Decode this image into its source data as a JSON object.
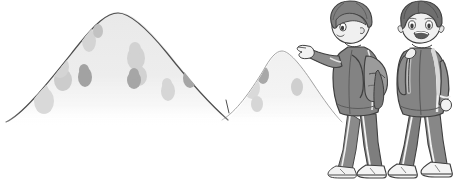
{
  "illustration": {
    "title": "Two boys in tracksuits looking at hills",
    "caption": "A boy points toward two hills while his friend smiles beside him",
    "style": "grayscale cartoon line drawing",
    "background_color": "#ffffff"
  },
  "palette": {
    "outline": "#3c3c3c",
    "hill_outline": "#555555",
    "hill_fill_front": "#eeeeee",
    "hill_fill_back": "#f4f4f4",
    "blob_light": "#dcdcdc",
    "blob_mid": "#c9c9c9",
    "blob_dark": "#a8a8a8",
    "skin": "#f0f0f0",
    "skin_shadow": "#d6d6d6",
    "hair_dark": "#5a5a5a",
    "hair_mid": "#8a8a8a",
    "hair_light": "#b4b4b4",
    "tracksuit_dark": "#6e6e6e",
    "tracksuit_mid": "#8d8d8d",
    "tracksuit_light": "#a5a5a5",
    "stripe": "#f2f2f2",
    "backpack": "#999999",
    "backpack_dark": "#7a7a7a",
    "shoe_white": "#f5f5f5",
    "shoe_grey": "#9a9a9a"
  },
  "landscape": {
    "name": "two-hills",
    "hills": [
      {
        "id": "hill-front",
        "label": "Large front hill",
        "peak_x": 116,
        "peak_y": 12,
        "left_x": 8,
        "right_x": 230,
        "base_y": 122
      },
      {
        "id": "hill-back",
        "label": "Smaller back hill",
        "peak_x": 272,
        "peak_y": 52,
        "left_x": 222,
        "right_x": 340,
        "base_y": 122
      }
    ],
    "blobs": [
      {
        "cx": 44,
        "cy": 101,
        "rx": 10,
        "ry": 13,
        "tone": "blob_light"
      },
      {
        "cx": 63,
        "cy": 80,
        "rx": 9,
        "ry": 11,
        "tone": "blob_mid"
      },
      {
        "cx": 60,
        "cy": 67,
        "rx": 9,
        "ry": 11,
        "tone": "blob_light"
      },
      {
        "cx": 85,
        "cy": 77,
        "rx": 7,
        "ry": 10,
        "tone": "blob_dark"
      },
      {
        "cx": 89,
        "cy": 41,
        "rx": 7,
        "ry": 11,
        "tone": "blob_light"
      },
      {
        "cx": 97,
        "cy": 31,
        "rx": 5,
        "ry": 7,
        "tone": "blob_mid"
      },
      {
        "cx": 136,
        "cy": 58,
        "rx": 9,
        "ry": 12,
        "tone": "blob_light"
      },
      {
        "cx": 138,
        "cy": 76,
        "rx": 8,
        "ry": 10,
        "tone": "blob_light"
      },
      {
        "cx": 134,
        "cy": 80,
        "rx": 7,
        "ry": 9,
        "tone": "blob_dark"
      },
      {
        "cx": 168,
        "cy": 91,
        "rx": 7,
        "ry": 10,
        "tone": "blob_light"
      },
      {
        "cx": 190,
        "cy": 78,
        "rx": 7,
        "ry": 10,
        "tone": "blob_dark"
      },
      {
        "cx": 252,
        "cy": 88,
        "rx": 8,
        "ry": 11,
        "tone": "blob_light"
      },
      {
        "cx": 257,
        "cy": 104,
        "rx": 6,
        "ry": 8,
        "tone": "blob_light"
      },
      {
        "cx": 263,
        "cy": 75,
        "rx": 6,
        "ry": 9,
        "tone": "blob_dark"
      },
      {
        "cx": 297,
        "cy": 87,
        "rx": 6,
        "ry": 9,
        "tone": "blob_mid"
      }
    ]
  },
  "characters": [
    {
      "id": "boy-pointing",
      "label": "Boy pointing at the hills",
      "position": "left",
      "facing": "left",
      "pose": "walking while pointing with index finger",
      "expression": "looking ahead",
      "hair": "short swept fringe",
      "outfit": "zip-up tracksuit jacket and track pants with side stripes",
      "accessory": "backpack on back",
      "footwear": "white sneakers"
    },
    {
      "id": "boy-smiling",
      "label": "Boy smiling beside him",
      "position": "right",
      "facing": "front",
      "pose": "walking, hand on backpack strap",
      "expression": "open-mouth smile",
      "hair": "short spiky",
      "outfit": "zip-up tracksuit jacket and track pants with side stripes",
      "accessory": "backpack straps over shoulders",
      "footwear": "white sneakers"
    }
  ]
}
